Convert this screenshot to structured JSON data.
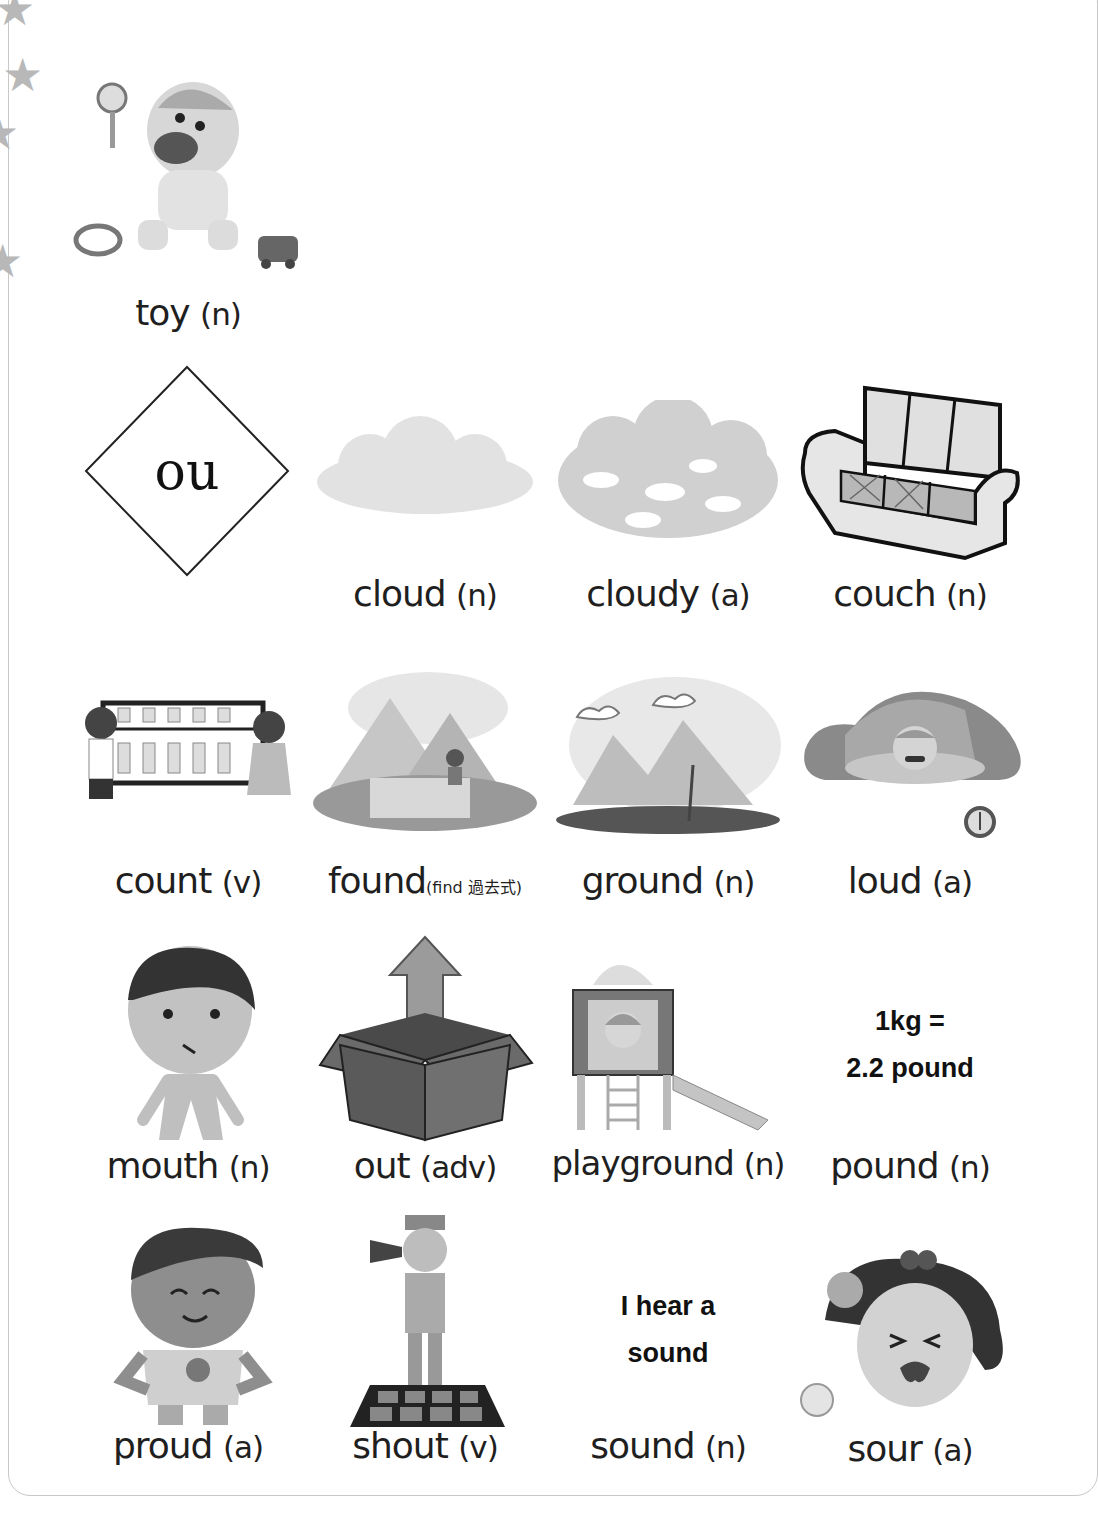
{
  "phonics_header": {
    "letters": "ou"
  },
  "intro_item": {
    "word": "toy",
    "pos": "(n)"
  },
  "vocabulary": [
    {
      "word": "cloud",
      "pos": "(n)",
      "image": "cloud-illustration"
    },
    {
      "word": "cloudy",
      "pos": "(a)",
      "image": "cloudy-sky-illustration"
    },
    {
      "word": "couch",
      "pos": "(n)",
      "image": "couch-illustration"
    },
    {
      "word": "count",
      "pos": "(v)",
      "image": "children-abacus-illustration"
    },
    {
      "word": "found",
      "pos": "",
      "note": "(find 過去式)",
      "image": "boy-digging-pyramids-illustration"
    },
    {
      "word": "ground",
      "pos": "(n)",
      "image": "ground-mountains-illustration"
    },
    {
      "word": "loud",
      "pos": "(a)",
      "image": "man-alarm-clock-illustration"
    },
    {
      "word": "mouth",
      "pos": "(n)",
      "image": "boy-mouth-illustration"
    },
    {
      "word": "out",
      "pos": "(adv)",
      "image": "box-arrow-out-illustration"
    },
    {
      "word": "playground",
      "pos": "(n)",
      "image": "playground-slide-illustration"
    },
    {
      "word": "pound",
      "pos": "(n)",
      "image": null,
      "text_lines": [
        "1kg =",
        "2.2 pound"
      ]
    },
    {
      "word": "proud",
      "pos": "(a)",
      "image": "proud-boy-ribbon-illustration"
    },
    {
      "word": "shout",
      "pos": "(v)",
      "image": "man-megaphone-illustration"
    },
    {
      "word": "sound",
      "pos": "(n)",
      "image": null,
      "text_lines": [
        "I hear a",
        "sound"
      ]
    },
    {
      "word": "sour",
      "pos": "(a)",
      "image": "girl-sour-lemon-illustration"
    }
  ],
  "colors": {
    "ink": "#1f1f1f",
    "frame": "#c8c8c8",
    "illustration_gray": "#9a9a9a"
  }
}
